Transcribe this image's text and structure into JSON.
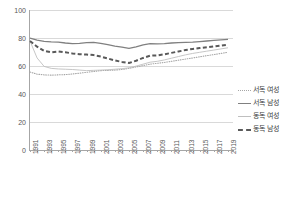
{
  "chart_data": {
    "type": "line",
    "title": "",
    "xlabel": "",
    "ylabel": "",
    "ylim": [
      0,
      100
    ],
    "yticks": [
      0,
      20,
      40,
      60,
      80,
      100
    ],
    "grid": true,
    "legend_position": "right",
    "x": [
      1991,
      1992,
      1993,
      1994,
      1995,
      1996,
      1997,
      1998,
      1999,
      2000,
      2001,
      2002,
      2003,
      2004,
      2005,
      2006,
      2007,
      2008,
      2009,
      2010,
      2011,
      2012,
      2013,
      2014,
      2015,
      2016,
      2017,
      2018,
      2019
    ],
    "xtick_labels": [
      "1991",
      "1993",
      "1995",
      "1997",
      "1999",
      "2001",
      "2003",
      "2005",
      "2007",
      "2009",
      "2011",
      "2013",
      "2015",
      "2017",
      "2019"
    ],
    "series": [
      {
        "name": "서독 여성",
        "style": "dotted",
        "color": "#a6a6a6",
        "values": [
          56.0,
          54.5,
          54.0,
          53.8,
          54.0,
          54.2,
          54.6,
          55.2,
          55.8,
          56.4,
          57.0,
          57.2,
          57.4,
          57.8,
          58.6,
          59.6,
          60.6,
          61.6,
          62.2,
          62.8,
          63.6,
          64.4,
          65.2,
          66.0,
          66.8,
          67.6,
          68.4,
          69.2,
          70.0
        ]
      },
      {
        "name": "서독 남성",
        "style": "solid",
        "color": "#808080",
        "values": [
          80.0,
          78.6,
          77.8,
          77.4,
          77.2,
          76.6,
          76.2,
          76.4,
          76.8,
          77.0,
          76.4,
          75.4,
          74.4,
          73.6,
          72.8,
          73.8,
          75.2,
          76.2,
          76.0,
          76.2,
          76.6,
          76.8,
          77.0,
          77.2,
          77.6,
          78.0,
          78.4,
          78.8,
          79.2
        ]
      },
      {
        "name": "동독 여성",
        "style": "thin-solid",
        "color": "#bfbfbf",
        "values": [
          78.0,
          66.0,
          60.0,
          58.6,
          58.2,
          58.0,
          57.8,
          57.4,
          57.0,
          57.2,
          57.4,
          57.6,
          58.0,
          58.4,
          59.0,
          60.2,
          61.6,
          63.0,
          63.6,
          64.6,
          65.8,
          67.0,
          68.2,
          69.2,
          70.0,
          70.8,
          71.6,
          72.4,
          73.2
        ]
      },
      {
        "name": "동독 남성",
        "style": "dashed",
        "color": "#595959",
        "values": [
          78.0,
          74.0,
          71.0,
          70.0,
          70.6,
          70.0,
          69.2,
          68.6,
          68.4,
          68.0,
          67.0,
          65.6,
          64.2,
          63.2,
          62.4,
          64.0,
          66.0,
          67.6,
          67.8,
          68.6,
          69.6,
          70.6,
          71.6,
          72.4,
          73.0,
          73.6,
          74.2,
          74.8,
          75.4
        ]
      }
    ]
  },
  "axis": {
    "y_labels": [
      "100",
      "80",
      "60",
      "40",
      "20",
      "0"
    ]
  },
  "legend": {
    "items": [
      {
        "label": "서독 여성",
        "key": "dotted-line-key"
      },
      {
        "label": "서독 남성",
        "key": "solid-line-key"
      },
      {
        "label": "동독 여성",
        "key": "thin-line-key"
      },
      {
        "label": "동독 남성",
        "key": "dashed-line-key"
      }
    ]
  }
}
